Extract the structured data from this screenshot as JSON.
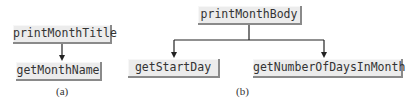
{
  "diagram_a": {
    "parent": "printMonthTitle",
    "child": "getMonthName",
    "caption": "(a)"
  },
  "diagram_b": {
    "parent": "printMonthBody",
    "children": [
      "getStartDay",
      "getNumberOfDaysInMonth"
    ],
    "caption": "(b)"
  }
}
